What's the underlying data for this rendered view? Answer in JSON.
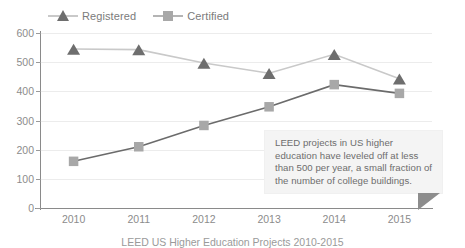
{
  "chart_data": {
    "type": "line",
    "title": "",
    "caption": "LEED US Higher Education Projects 2010-2015",
    "xlabel": "",
    "ylabel": "",
    "categories": [
      "2010",
      "2011",
      "2012",
      "2013",
      "2014",
      "2015"
    ],
    "ylim": [
      0,
      600
    ],
    "yticks": [
      0,
      100,
      200,
      300,
      400,
      500,
      600
    ],
    "ytick_labels": [
      "0",
      "100",
      "200",
      "300",
      "400",
      "500",
      "600"
    ],
    "grid": true,
    "legend_position": "top-left",
    "series": [
      {
        "name": "Registered",
        "marker": "triangle",
        "line_color": "#c9c9c9",
        "marker_color": "#6e6e6e",
        "values": [
          545,
          543,
          497,
          462,
          527,
          443
        ]
      },
      {
        "name": "Certified",
        "marker": "square",
        "line_color": "#6b6b6b",
        "marker_color": "#a8a8a8",
        "values": [
          160,
          210,
          283,
          347,
          423,
          393
        ]
      }
    ],
    "annotations": [
      {
        "name": "callout",
        "text": "LEED projects in US higher education have leveled off at less than 500 per year, a small fraction of the number of college buildings."
      }
    ]
  },
  "legend": {
    "items": [
      {
        "label": "Registered",
        "icon": "triangle-marker-icon"
      },
      {
        "label": "Certified",
        "icon": "square-marker-icon"
      }
    ]
  },
  "callout": {
    "text": "LEED projects in US higher education have leveled off at less than 500 per year, a small fraction of the number of college buildings."
  },
  "caption": {
    "text": "LEED US Higher Education Projects 2010-2015"
  },
  "colors": {
    "registered_line": "#c9c9c9",
    "registered_marker": "#6e6e6e",
    "certified_line": "#6b6b6b",
    "certified_marker": "#a8a8a8",
    "grid": "#ececec",
    "axis": "#8a8a8a",
    "callout_bg": "#f4f4f4",
    "callout_pointer": "#8d8d8d",
    "text": "#8c8c8c"
  }
}
